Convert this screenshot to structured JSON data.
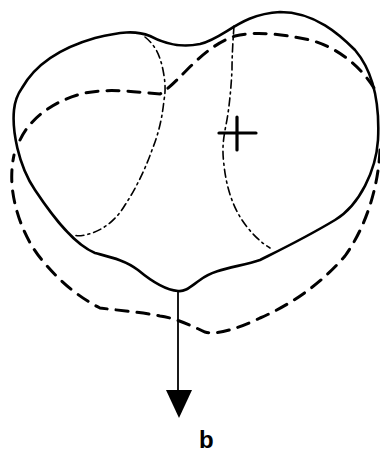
{
  "figure": {
    "panel_label": "b",
    "elements": {
      "solid_outline": "outer contour (solid line)",
      "dashed_outline": "displaced contour (dashed line)",
      "internal_lines": "dash-dot internal boundary lines",
      "center_marker": "cross marker",
      "arrow": "downward arrow from bottom apex"
    },
    "colors": {
      "stroke": "#000000",
      "background": "#ffffff"
    }
  }
}
